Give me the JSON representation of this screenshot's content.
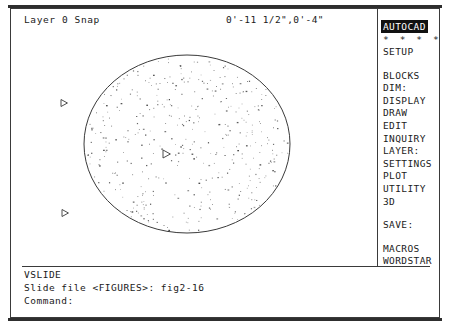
{
  "app": {
    "name": "AutoCAD",
    "screen_width": 450,
    "screen_height": 326,
    "ink_color": "#1a1a1a",
    "background_color": "#ffffff",
    "highlight_bg": "#111111",
    "highlight_fg": "#ffffff"
  },
  "status": {
    "layer_text": "Layer 0 Snap",
    "coordinates": "0'-11 1/2\",0'-4\""
  },
  "side_menu": {
    "title": "AUTOCAD",
    "stars": "* * * *",
    "items": [
      {
        "label": "SETUP",
        "gap_after": true
      },
      {
        "label": "BLOCKS",
        "gap_after": false
      },
      {
        "label": "DIM:",
        "gap_after": false
      },
      {
        "label": "DISPLAY",
        "gap_after": false
      },
      {
        "label": "DRAW",
        "gap_after": false
      },
      {
        "label": "EDIT",
        "gap_after": false
      },
      {
        "label": "INQUIRY",
        "gap_after": false
      },
      {
        "label": "LAYER:",
        "gap_after": false
      },
      {
        "label": "SETTINGS",
        "gap_after": false
      },
      {
        "label": "PLOT",
        "gap_after": false
      },
      {
        "label": "UTILITY",
        "gap_after": false
      },
      {
        "label": "3D",
        "gap_after": true
      },
      {
        "label": "SAVE:",
        "gap_after": true
      },
      {
        "label": "MACROS",
        "gap_after": false
      },
      {
        "label": "WORDSTAR",
        "gap_after": false
      }
    ]
  },
  "command_area": {
    "lines": [
      "VSLIDE",
      "Slide file <FIGURES>: fig2-16",
      "Command:"
    ]
  },
  "drawing": {
    "description": "Hatched ellipse with three direction arrow markers",
    "ellipse": {
      "cx": 176,
      "cy": 113,
      "rx": 103,
      "ry": 89,
      "stroke": "#3a3a3a",
      "fill": "none"
    },
    "hatch": {
      "pattern_name": "dots",
      "dot_color": "#3f3f3f",
      "dot_count": 430
    },
    "markers": [
      {
        "name": "arrow-marker-1",
        "x": 50,
        "y": 72,
        "size": 7,
        "direction": "right"
      },
      {
        "name": "arrow-marker-2",
        "x": 152,
        "y": 123,
        "size": 8,
        "direction": "right"
      },
      {
        "name": "arrow-marker-3",
        "x": 51,
        "y": 182,
        "size": 7,
        "direction": "right"
      }
    ]
  }
}
